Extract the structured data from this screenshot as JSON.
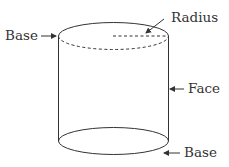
{
  "diagram": {
    "stroke_color": "#333333",
    "labels": {
      "top_base": "Base",
      "radius": "Radius",
      "face": "Face",
      "bottom_base": "Base"
    }
  }
}
